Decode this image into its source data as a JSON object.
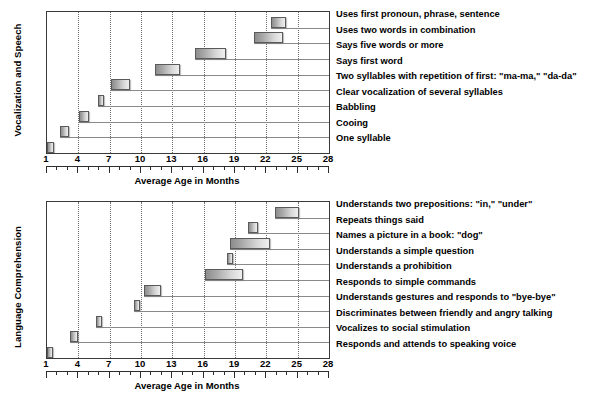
{
  "figure": {
    "background": "#ffffff",
    "bar_fill_dark": "#8d8d8d",
    "bar_fill_light": "#efefef",
    "bar_border": "#5a5a5a",
    "grid_color": "#6f6f6f"
  },
  "chart_data": [
    {
      "id": "vocalization-and-speech",
      "type": "bar",
      "orientation": "horizontal-range",
      "title": "",
      "ylabel": "Vocalization and Speech",
      "xlabel": "Average Age in Months",
      "xlim": [
        1,
        28
      ],
      "xticks": [
        1,
        4,
        7,
        10,
        13,
        16,
        19,
        22,
        25,
        28
      ],
      "xtick_labels": [
        "1",
        "4",
        "7",
        "10",
        "13",
        "16",
        "19",
        "22",
        "25",
        "28"
      ],
      "minor_tick_step": 1,
      "grid": "vertical-dotted",
      "legend": "none",
      "categories": [
        "Uses first pronoun, phrase, sentence",
        "Uses two words in combination",
        "Says five words or more",
        "Says first word",
        "Two syllables with repetition of first: \"ma-ma,\" \"da-da\"",
        "Clear vocalization of several syllables",
        "Babbling",
        "Cooing",
        "One syllable"
      ],
      "bars": [
        {
          "label": "Uses first pronoun, phrase, sentence",
          "start": 22.4,
          "end": 23.9
        },
        {
          "label": "Uses two words in combination",
          "start": 20.8,
          "end": 23.6
        },
        {
          "label": "Says five words or more",
          "start": 15.2,
          "end": 18.1
        },
        {
          "label": "Says first word",
          "start": 11.3,
          "end": 13.7
        },
        {
          "label": "Two syllables with repetition of first: \"ma-ma,\" \"da-da\"",
          "start": 7.1,
          "end": 8.9
        },
        {
          "label": "Clear vocalization of several syllables",
          "start": 5.9,
          "end": 6.5
        },
        {
          "label": "Babbling",
          "start": 4.1,
          "end": 5.0
        },
        {
          "label": "Cooing",
          "start": 2.2,
          "end": 3.1
        },
        {
          "label": "One syllable",
          "start": 1.0,
          "end": 1.7
        }
      ]
    },
    {
      "id": "language-comprehension",
      "type": "bar",
      "orientation": "horizontal-range",
      "title": "",
      "ylabel": "Language Comprehension",
      "xlabel": "Average Age in Months",
      "xlim": [
        1,
        28
      ],
      "xticks": [
        1,
        4,
        7,
        10,
        13,
        16,
        19,
        22,
        25,
        28
      ],
      "xtick_labels": [
        "1",
        "4",
        "7",
        "10",
        "13",
        "16",
        "19",
        "22",
        "25",
        "28"
      ],
      "minor_tick_step": 1,
      "grid": "vertical-dotted",
      "legend": "none",
      "categories": [
        "Understands two prepositions: \"in,\" \"under\"",
        "Repeats things said",
        "Names a picture in a book: \"dog\"",
        "Understands a simple question",
        "Understands a prohibition",
        "Responds to simple commands",
        "Understands gestures and responds to \"bye-bye\"",
        "Discriminates between friendly and angry talking",
        "Vocalizes to social stimulation",
        "Responds and attends to speaking voice"
      ],
      "bars": [
        {
          "label": "Understands two prepositions: \"in,\" \"under\"",
          "start": 22.8,
          "end": 25.1
        },
        {
          "label": "Repeats things said",
          "start": 20.2,
          "end": 21.2
        },
        {
          "label": "Names a picture in a book: \"dog\"",
          "start": 18.5,
          "end": 22.4
        },
        {
          "label": "Understands a simple question",
          "start": 18.2,
          "end": 18.8
        },
        {
          "label": "Understands a prohibition",
          "start": 16.1,
          "end": 19.8
        },
        {
          "label": "Responds to simple commands",
          "start": 10.3,
          "end": 11.9
        },
        {
          "label": "Understands gestures and responds to \"bye-bye\"",
          "start": 9.3,
          "end": 9.9
        },
        {
          "label": "Discriminates between friendly and angry talking",
          "start": 5.7,
          "end": 6.3
        },
        {
          "label": "Vocalizes to social stimulation",
          "start": 3.2,
          "end": 4.0
        },
        {
          "label": "Responds and attends to speaking voice",
          "start": 1.0,
          "end": 1.6
        }
      ]
    }
  ],
  "charts": {
    "vocalization": {
      "ylabel": "Vocalization and Speech",
      "xlabel": "Average Age in Months",
      "labels": [
        "Uses first pronoun, phrase, sentence",
        "Uses two words in combination",
        "Says five words or more",
        "Says first word",
        "Two syllables with repetition of first: \"ma-ma,\" \"da-da\"",
        "Clear vocalization of several syllables",
        "Babbling",
        "Cooing",
        "One syllable"
      ]
    },
    "comprehension": {
      "ylabel": "Language Comprehension",
      "xlabel": "Average Age in Months",
      "labels": [
        "Understands two prepositions: \"in,\" \"under\"",
        "Repeats things said",
        "Names a picture in a book: \"dog\"",
        "Understands a simple question",
        "Understands a prohibition",
        "Responds to simple commands",
        "Understands gestures and responds to \"bye-bye\"",
        "Discriminates between friendly and angry talking",
        "Vocalizes to social stimulation",
        "Responds and attends to speaking voice"
      ]
    }
  }
}
